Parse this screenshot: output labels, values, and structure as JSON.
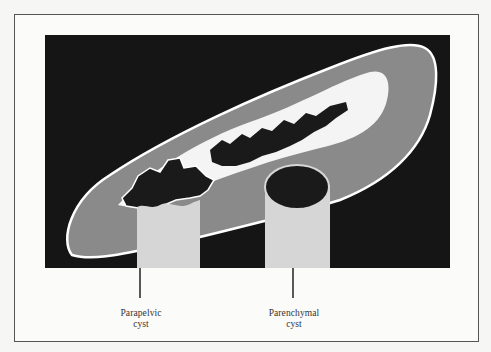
{
  "figure": {
    "labels": [
      {
        "id": "parapelvic",
        "line1": "Parapelvic",
        "line2": "cyst"
      },
      {
        "id": "parenchymal",
        "line1": "Parenchymal",
        "line2": "cyst"
      }
    ],
    "colors": {
      "background": "#151515",
      "parenchyma": "#8a8a8a",
      "sinus_fat": "#f4f4f4",
      "collecting_system": "#1a1a1a",
      "cyst_fill": "#d6d6d6",
      "capsule_outline": "#ffffff"
    }
  }
}
